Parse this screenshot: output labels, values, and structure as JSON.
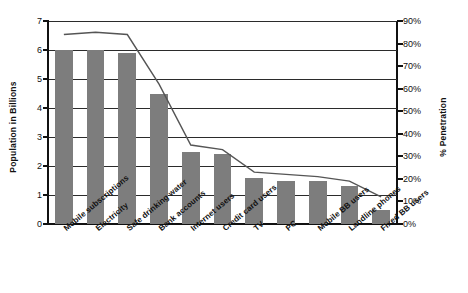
{
  "chart_data": {
    "type": "bar",
    "title": "",
    "xlabel": "",
    "ylabel": "Population in Billions",
    "y2label": "% Penetration",
    "grid": true,
    "legend": "none",
    "ylim": [
      0,
      7
    ],
    "y2lim": [
      0,
      90
    ],
    "yticks": [
      "0",
      "1",
      "2",
      "3",
      "4",
      "5",
      "6",
      "7"
    ],
    "y2ticks": [
      "0%",
      "10%",
      "20%",
      "30%",
      "40%",
      "50%",
      "60%",
      "70%",
      "80%",
      "90%"
    ],
    "categories": [
      "Mobile subscriptions",
      "Electricity",
      "Safe drinking water",
      "Bank accounts",
      "Internet users",
      "Credit card users",
      "TV",
      "PC",
      "Mobile BB users",
      "Landline phones",
      "Fixed BB users"
    ],
    "series": [
      {
        "name": "Population in Billions",
        "type": "bar",
        "axis": "left",
        "color": "#7d7d7d",
        "values": [
          6.0,
          6.0,
          5.9,
          4.5,
          2.5,
          2.4,
          1.6,
          1.5,
          1.5,
          1.3,
          0.5
        ]
      },
      {
        "name": "% Penetration",
        "type": "line",
        "axis": "right",
        "color": "#555555",
        "values": [
          84,
          85,
          84,
          62,
          35,
          33,
          23,
          22,
          21,
          19,
          12
        ]
      }
    ]
  }
}
